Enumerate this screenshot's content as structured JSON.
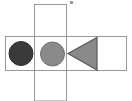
{
  "figure": {
    "width": 132,
    "height": 101,
    "background_color": "#ffffff"
  },
  "colors": {
    "background": "#ffffff",
    "box_stroke": "#999999",
    "box_fill": "#ffffff",
    "dark_circle_fill": "#3a3a3a",
    "dark_circle_stroke": "#2e2e2e",
    "gray_circle_fill": "#8a8a8a",
    "gray_circle_stroke": "#6f6f6f",
    "triangle_fill": "#8a8a8a",
    "triangle_stroke": "#555555",
    "speck": "#9a9a9a"
  },
  "shapes": {
    "vertical_box": {
      "name": "vertical rectangle",
      "x": 34.5,
      "y": 4.5,
      "width": 32,
      "height": 96.5,
      "stroke_width": 1
    },
    "horizontal_box": {
      "name": "horizontal rectangle",
      "x": 5.5,
      "y": 36.5,
      "width": 121,
      "height": 34,
      "stroke_width": 1
    },
    "dark_circle": {
      "name": "dark filled circle",
      "cx": 21,
      "cy": 53.5,
      "r": 12,
      "stroke_width": 1
    },
    "gray_circle": {
      "name": "gray filled circle",
      "cx": 52.5,
      "cy": 54,
      "r": 12,
      "stroke_width": 1
    },
    "triangle": {
      "name": "left pointing triangle",
      "points": "68,53.5 97,37.5 97,70",
      "stroke_width": 1.2
    },
    "speck": {
      "name": "small speckle artifact",
      "x": 70,
      "y": 1,
      "width": 3,
      "height": 3
    }
  }
}
